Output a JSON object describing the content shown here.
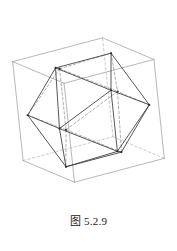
{
  "figure": {
    "caption_label": "图",
    "caption_number": "5.2.9",
    "caption_full": "图 5.2.9",
    "title": ""
  },
  "style": {
    "background": "#ffffff",
    "cube_stroke": "#9a9a9a",
    "cube_hidden_stroke": "#b8b8b8",
    "solid_stroke": "#3a3a3a",
    "hidden_stroke": "#8c8c8c",
    "vertex_fill": "#2b2b2b",
    "caption_color": "#1a1a1a",
    "cube_width": 0.7,
    "solid_width": 0.85,
    "hidden_width": 0.7,
    "hidden_dash": "2.6,2.2"
  },
  "geometry": {
    "projection": {
      "type": "orthographic",
      "cx": 88.5,
      "cy": 110,
      "scale": 52,
      "yaw_deg": 28,
      "pitch_deg": 17,
      "roll_deg": 6
    },
    "cube": {
      "name": "circumscribing-cube",
      "half_edge": 1.0,
      "vertices": [
        [
          -1,
          -1,
          -1
        ],
        [
          1,
          -1,
          -1
        ],
        [
          1,
          1,
          -1
        ],
        [
          -1,
          1,
          -1
        ],
        [
          -1,
          -1,
          1
        ],
        [
          1,
          -1,
          1
        ],
        [
          1,
          1,
          1
        ],
        [
          -1,
          1,
          1
        ]
      ],
      "edges": [
        [
          0,
          1
        ],
        [
          1,
          2
        ],
        [
          2,
          3
        ],
        [
          3,
          0
        ],
        [
          4,
          5
        ],
        [
          5,
          6
        ],
        [
          6,
          7
        ],
        [
          7,
          4
        ],
        [
          0,
          4
        ],
        [
          1,
          5
        ],
        [
          2,
          6
        ],
        [
          3,
          7
        ]
      ]
    },
    "icosahedron": {
      "name": "inscribed-icosahedron",
      "phi": 0.6180339887,
      "vertex_count": 12,
      "edge_count": 30,
      "face_count": 20,
      "vertices": [
        [
          0,
          0.6180339887,
          1
        ],
        [
          0,
          -0.6180339887,
          1
        ],
        [
          0,
          0.6180339887,
          -1
        ],
        [
          0,
          -0.6180339887,
          -1
        ],
        [
          0.6180339887,
          1,
          0
        ],
        [
          -0.6180339887,
          1,
          0
        ],
        [
          0.6180339887,
          -1,
          0
        ],
        [
          -0.6180339887,
          -1,
          0
        ],
        [
          1,
          0,
          0.6180339887
        ],
        [
          1,
          0,
          -0.6180339887
        ],
        [
          -1,
          0,
          0.6180339887
        ],
        [
          -1,
          0,
          -0.6180339887
        ]
      ],
      "edges": [
        [
          0,
          1
        ],
        [
          0,
          4
        ],
        [
          0,
          5
        ],
        [
          0,
          8
        ],
        [
          0,
          10
        ],
        [
          1,
          6
        ],
        [
          1,
          7
        ],
        [
          1,
          8
        ],
        [
          1,
          10
        ],
        [
          2,
          3
        ],
        [
          2,
          4
        ],
        [
          2,
          5
        ],
        [
          2,
          9
        ],
        [
          2,
          11
        ],
        [
          3,
          6
        ],
        [
          3,
          7
        ],
        [
          3,
          9
        ],
        [
          3,
          11
        ],
        [
          4,
          5
        ],
        [
          4,
          8
        ],
        [
          4,
          9
        ],
        [
          5,
          10
        ],
        [
          5,
          11
        ],
        [
          6,
          7
        ],
        [
          6,
          8
        ],
        [
          6,
          9
        ],
        [
          7,
          10
        ],
        [
          7,
          11
        ],
        [
          8,
          9
        ],
        [
          10,
          11
        ]
      ]
    }
  }
}
